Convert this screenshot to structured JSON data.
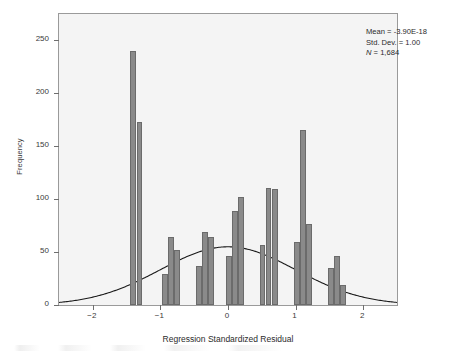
{
  "chart_data": {
    "type": "bar",
    "title": "",
    "subtitle": "",
    "xlabel": "Regression Standardized Residual",
    "ylabel": "Frequency",
    "xlim": [
      -2.5,
      2.5
    ],
    "ylim": [
      0,
      275
    ],
    "xticks": [
      -2,
      -1,
      0,
      1,
      2
    ],
    "xticklabels": [
      "−2",
      "−1",
      "0",
      "1",
      "2"
    ],
    "yticks": [
      0,
      50,
      100,
      150,
      200,
      250
    ],
    "yticklabels": [
      "0",
      "50",
      "100",
      "150",
      "200",
      "250"
    ],
    "grid": false,
    "legend": false,
    "bin_width": 0.085,
    "bar_color": "#8a8a8a",
    "bar_edge_color": "#6b6b6b",
    "panel_color": "#f4f4f4",
    "curve_color": "#1a1a1a",
    "x": [
      -1.4,
      -1.31,
      -0.93,
      -0.84,
      -0.75,
      -0.43,
      -0.34,
      -0.25,
      0.01,
      0.1,
      0.19,
      0.51,
      0.6,
      0.69,
      1.02,
      1.11,
      1.2,
      1.52,
      1.61,
      1.7
    ],
    "values": [
      240,
      173,
      29,
      64,
      52,
      37,
      69,
      64,
      46,
      89,
      102,
      57,
      111,
      110,
      60,
      165,
      77,
      35,
      46,
      19
    ],
    "overlay": {
      "type": "line",
      "name": "normal curve",
      "mean": 0.0,
      "std_dev": 1.0,
      "peak_value": 55,
      "description": "Normal distribution curve overlay"
    }
  },
  "annotation": {
    "mean_label": "Mean = -3.90E-18",
    "std_dev_label": "Std. Dev. = 1.00",
    "n_symbol": "N",
    "n_value": " = 1,684"
  }
}
